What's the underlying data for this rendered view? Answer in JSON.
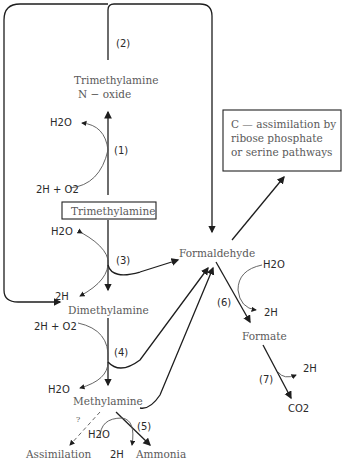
{
  "diagram": {
    "compounds": {
      "tmao_line1": "Trimethylamine",
      "tmao_line2": "N − oxide",
      "tma": "Trimethylamine",
      "dma": "Dimethylamine",
      "mma": "Methylamine",
      "formaldehyde": "Formaldehyde",
      "formate": "Formate",
      "co2": "CO2",
      "ammonia": "Ammonia",
      "assimilation": "Assimilation"
    },
    "assimilation_box": {
      "line1": "C — assimilation by",
      "line2": "ribose phosphate",
      "line3": "or serine pathways"
    },
    "steps": [
      "(1)",
      "(2)",
      "(3)",
      "(4)",
      "(5)",
      "(6)",
      "(7)"
    ],
    "cofactors": {
      "h2o": "H2O",
      "two_h": "2H",
      "two_h_o2": "2H + O2"
    },
    "question_mark": "?"
  }
}
